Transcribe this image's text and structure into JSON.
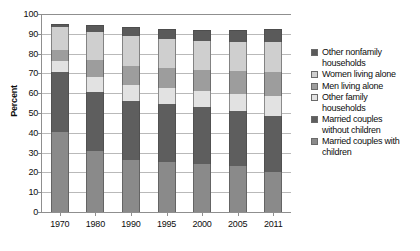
{
  "chart_data": {
    "type": "bar",
    "subtype": "stacked-bar-percent",
    "title": "",
    "subtitle": "",
    "xlabel": "",
    "ylabel": "Percent",
    "ylim": [
      0,
      100
    ],
    "ytick_step": 10,
    "yticks": [
      0,
      10,
      20,
      30,
      40,
      50,
      60,
      70,
      80,
      90,
      100
    ],
    "ytick_labels": [
      "0",
      "10",
      "20",
      "30",
      "40",
      "50",
      "60",
      "70",
      "80",
      "90",
      "100"
    ],
    "grid": true,
    "grid_axis": "y",
    "legend_position": "right",
    "categories": [
      "1970",
      "1980",
      "1990",
      "1995",
      "2000",
      "2005",
      "2011"
    ],
    "stack_order_bottom_to_top": [
      "Married couples with children",
      "Married couples without children",
      "Other family households",
      "Men living alone",
      "Women living alone",
      "Other nonfamily households"
    ],
    "series": [
      {
        "name": "Married couples with children",
        "color": "#8a8a8a",
        "values": [
          40.3,
          30.9,
          26.3,
          25.5,
          24.1,
          23.0,
          20.2
        ]
      },
      {
        "name": "Married couples without children",
        "color": "#5e5e5e",
        "values": [
          30.3,
          29.9,
          29.8,
          28.9,
          28.7,
          28.2,
          28.1
        ]
      },
      {
        "name": "Other family households",
        "color": "#e2e2e2",
        "values": [
          5.6,
          7.5,
          8.0,
          8.2,
          8.2,
          8.6,
          10.1
        ]
      },
      {
        "name": "Men living alone",
        "color": "#9d9d9d",
        "values": [
          5.6,
          8.6,
          9.7,
          10.2,
          10.7,
          11.3,
          12.3
        ]
      },
      {
        "name": "Women living alone",
        "color": "#cfcfcf",
        "values": [
          11.5,
          14.0,
          14.9,
          14.7,
          14.8,
          15.0,
          15.2
        ]
      },
      {
        "name": "Other nonfamily households",
        "color": "#5a5a5a",
        "values": [
          1.7,
          3.6,
          4.6,
          4.8,
          5.7,
          6.1,
          6.6
        ]
      }
    ],
    "legend_entries": [
      {
        "label": "Other nonfamily\nhouseholds",
        "color": "#5a5a5a"
      },
      {
        "label": "Women living alone",
        "color": "#cfcfcf"
      },
      {
        "label": "Men living alone",
        "color": "#9d9d9d"
      },
      {
        "label": "Other family\nhouseholds",
        "color": "#e2e2e2"
      },
      {
        "label": "Married couples\nwithout children",
        "color": "#5e5e5e"
      },
      {
        "label": "Married couples with\nchildren",
        "color": "#8a8a8a"
      }
    ]
  },
  "colors": {
    "axis": "#8f8f8f",
    "grid": "#b9b9b9",
    "text": "#0d0d0d",
    "background": "#ffffff"
  }
}
